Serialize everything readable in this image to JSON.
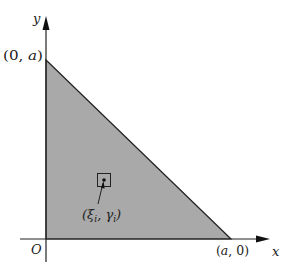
{
  "figure": {
    "axes": {
      "x_label": "x",
      "y_label": "y",
      "origin_label": "O"
    },
    "region": {
      "shape": "triangle",
      "fill_color": "#a9a9a9",
      "vertices": [
        "(0, a)",
        "(0, 0)",
        "(a, 0)"
      ]
    },
    "labels": {
      "top_vertex": "(0, a)",
      "right_vertex": "(a, 0)",
      "sample_point": "(ξi, γi)",
      "sample_point_var1": "ξ",
      "sample_point_sub1": "i",
      "sample_point_var2": "γ",
      "sample_point_sub2": "i"
    }
  }
}
